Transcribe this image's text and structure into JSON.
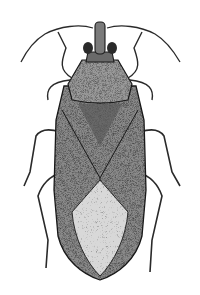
{
  "image": {
    "subject": "insect-illustration",
    "description": "Stippled pen illustration of a true bug (Hemiptera), dorsal view",
    "colors": {
      "background": "#ffffff",
      "ink": "#1a1a1a",
      "mid": "#6e6e6e",
      "light": "#bdbdbd"
    }
  }
}
